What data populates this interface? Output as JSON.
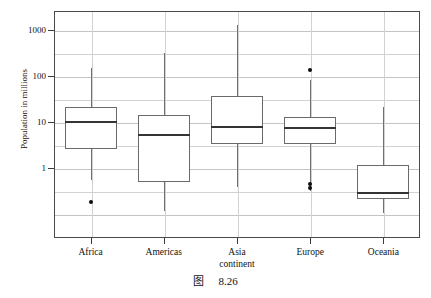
{
  "figure": {
    "caption_label": "图",
    "caption_number": "8.26"
  },
  "chart_data": {
    "type": "box",
    "title": "",
    "xlabel": "continent",
    "ylabel": "Population in millions",
    "yscale": "log",
    "ylim": [
      0.1,
      2000
    ],
    "grid": true,
    "legend": "none",
    "categories": [
      "Africa",
      "Americas",
      "Asia",
      "Europe",
      "Oceania"
    ],
    "ytick_labels": [
      "1000",
      "100",
      "10",
      "1"
    ],
    "ytick_values": [
      1000,
      100,
      10,
      1
    ],
    "boxes": [
      {
        "category": "Africa",
        "whisker_low": 0.55,
        "q1": 2.6,
        "median": 10.6,
        "q3": 21.0,
        "whisker_high": 150.0,
        "outliers": [
          0.18
        ]
      },
      {
        "category": "Americas",
        "whisker_low": 0.115,
        "q1": 0.5,
        "median": 5.6,
        "q3": 14.5,
        "whisker_high": 310.0,
        "outliers": []
      },
      {
        "category": "Asia",
        "whisker_low": 0.39,
        "q1": 3.4,
        "median": 8.2,
        "q3": 37.0,
        "whisker_high": 1300.0,
        "outliers": []
      },
      {
        "category": "Europe",
        "whisker_low": 0.32,
        "q1": 3.3,
        "median": 7.6,
        "q3": 13.0,
        "whisker_high": 82.0,
        "outliers": [
          135.0,
          0.46,
          0.37
        ]
      },
      {
        "category": "Oceania",
        "whisker_low": 0.105,
        "q1": 0.21,
        "median": 0.3,
        "q3": 1.18,
        "whisker_high": 21.0,
        "outliers": []
      }
    ]
  },
  "colors": {
    "frame": "#4a4a4a",
    "grid": "#d2d2d2",
    "box_edge": "#6a6a6a",
    "median": "#343434",
    "whisker": "#6f6f6f",
    "outlier": "#0d0d0d",
    "text": "#121212",
    "background": "#ffffff"
  }
}
